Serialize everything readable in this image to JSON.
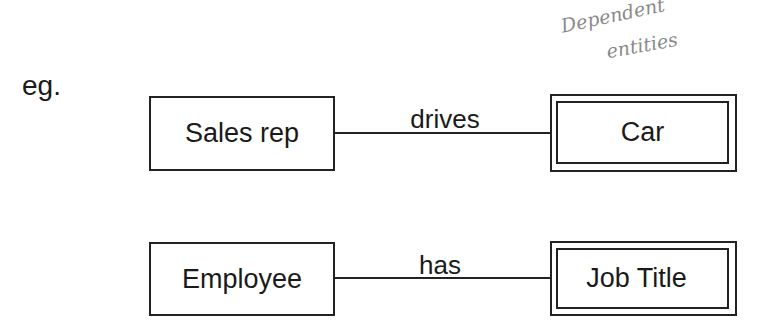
{
  "intro": "eg.",
  "annotation": {
    "line1": "Dependent",
    "line2": "entities"
  },
  "rows": [
    {
      "entity": "Sales rep",
      "relationship": "drives",
      "weak_entity": "Car"
    },
    {
      "entity": "Employee",
      "relationship": "has",
      "weak_entity": "Job Title"
    }
  ]
}
